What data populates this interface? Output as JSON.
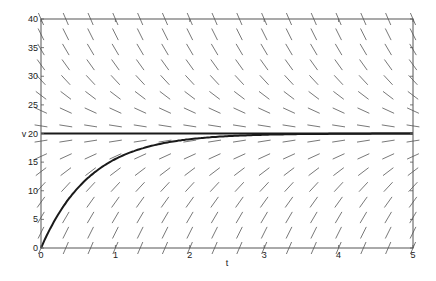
{
  "chart_data": {
    "type": "line",
    "subtype": "direction-field",
    "title": "",
    "xlabel": "t",
    "ylabel": "v",
    "xlim": [
      0,
      5
    ],
    "ylim": [
      0,
      40
    ],
    "grid": false,
    "legend": null,
    "xticks": [
      0,
      1,
      2,
      3,
      4,
      5
    ],
    "yticks": [
      0,
      5,
      10,
      15,
      20,
      25,
      30,
      35,
      40
    ],
    "xtick_labels": [
      "0",
      "1",
      "2",
      "3",
      "4",
      "5"
    ],
    "ytick_labels": [
      "0",
      "5",
      "10",
      "15",
      "20",
      "25",
      "30",
      "35",
      "40"
    ],
    "ode": "dv/dt = k(20 - v)",
    "k": 1.5,
    "equilibrium": 20,
    "direction_field": {
      "t_count": 16,
      "v_count": 16,
      "t_range": [
        0,
        5
      ],
      "v_range": [
        0,
        40
      ],
      "segment_length_px": 13,
      "color": "#555555"
    },
    "series": [
      {
        "name": "equilibrium v=20",
        "kind": "hline",
        "y": 20,
        "color": "#1a1a1a",
        "width": 2
      },
      {
        "name": "solution v(0)=0",
        "kind": "curve",
        "x": [
          0,
          0.25,
          0.5,
          0.75,
          1.0,
          1.25,
          1.5,
          1.75,
          2.0,
          2.5,
          3.0,
          3.5,
          4.0,
          4.5,
          5.0
        ],
        "values": [
          0,
          6.25,
          10.55,
          13.51,
          15.54,
          16.94,
          17.89,
          18.55,
          19.0,
          19.53,
          19.78,
          19.9,
          19.95,
          19.98,
          19.99
        ],
        "color": "#1a1a1a",
        "width": 2
      }
    ],
    "annotations": [
      {
        "text": ">",
        "at_y": 20,
        "position": "left-of-ylabel"
      }
    ]
  }
}
